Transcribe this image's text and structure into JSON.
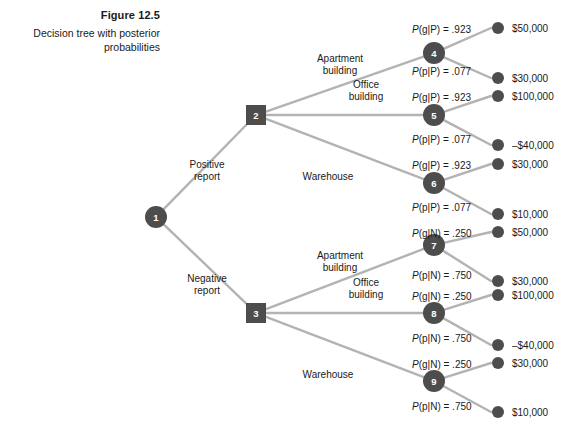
{
  "figure": {
    "number": "Figure 12.5",
    "description": "Decision tree with posterior probabilities"
  },
  "colors": {
    "node_fill": "#4d4d4d",
    "node_text": "#ffffff",
    "branch_line": "#b3b3b3",
    "terminal_dot": "#4d4d4d",
    "text": "#1a1a1a",
    "background": "#ffffff"
  },
  "chart_data": {
    "type": "diagram",
    "title": "Decision tree with posterior probabilities",
    "nodes": [
      {
        "id": "1",
        "label": "1",
        "shape": "circle",
        "x": 156,
        "y": 217
      },
      {
        "id": "2",
        "label": "2",
        "shape": "square",
        "x": 256,
        "y": 115
      },
      {
        "id": "3",
        "label": "3",
        "shape": "square",
        "x": 256,
        "y": 313
      },
      {
        "id": "4",
        "label": "4",
        "shape": "circle",
        "x": 434,
        "y": 53
      },
      {
        "id": "5",
        "label": "5",
        "shape": "circle",
        "x": 434,
        "y": 115
      },
      {
        "id": "6",
        "label": "6",
        "shape": "circle",
        "x": 434,
        "y": 183
      },
      {
        "id": "7",
        "label": "7",
        "shape": "circle",
        "x": 434,
        "y": 245
      },
      {
        "id": "8",
        "label": "8",
        "shape": "circle",
        "x": 434,
        "y": 313
      },
      {
        "id": "9",
        "label": "9",
        "shape": "circle",
        "x": 434,
        "y": 381
      }
    ],
    "stage1_branches": [
      {
        "from": "1",
        "to": "2",
        "label_line1": "Positive",
        "label_line2": "report"
      },
      {
        "from": "1",
        "to": "3",
        "label_line1": "Negative",
        "label_line2": "report"
      }
    ],
    "stage2_branches": [
      {
        "from": "2",
        "to": "4",
        "label_line1": "Apartment",
        "label_line2": "building"
      },
      {
        "from": "2",
        "to": "5",
        "label_line1": "Office",
        "label_line2": "building"
      },
      {
        "from": "2",
        "to": "6",
        "label_line1": "Warehouse",
        "label_line2": ""
      },
      {
        "from": "3",
        "to": "7",
        "label_line1": "Apartment",
        "label_line2": "building"
      },
      {
        "from": "3",
        "to": "8",
        "label_line1": "Office",
        "label_line2": "building"
      },
      {
        "from": "3",
        "to": "9",
        "label_line1": "Warehouse",
        "label_line2": ""
      }
    ],
    "outcomes": [
      {
        "from": "4",
        "prob_var": "P",
        "prob_args": "g|P",
        "prob_value": ".923",
        "prob_text": "P(g|P) = .923",
        "payoff": "$50,000",
        "dot_x": 498,
        "dot_y": 28,
        "label_x": 412,
        "label_y": 33
      },
      {
        "from": "4",
        "prob_var": "P",
        "prob_args": "p|P",
        "prob_value": ".077",
        "prob_text": "P(p|P) = .077",
        "payoff": "$30,000",
        "dot_x": 498,
        "dot_y": 78,
        "label_x": 412,
        "label_y": 75
      },
      {
        "from": "5",
        "prob_var": "P",
        "prob_args": "g|P",
        "prob_value": ".923",
        "prob_text": "P(g|P) = .923",
        "payoff": "$100,000",
        "dot_x": 498,
        "dot_y": 96,
        "label_x": 412,
        "label_y": 101
      },
      {
        "from": "5",
        "prob_var": "P",
        "prob_args": "p|P",
        "prob_value": ".077",
        "prob_text": "P(p|P) = .077",
        "payoff": "–$40,000",
        "dot_x": 498,
        "dot_y": 145,
        "label_x": 412,
        "label_y": 143
      },
      {
        "from": "6",
        "prob_var": "P",
        "prob_args": "g|P",
        "prob_value": ".923",
        "prob_text": "P(g|P) = .923",
        "payoff": "$30,000",
        "dot_x": 498,
        "dot_y": 164,
        "label_x": 412,
        "label_y": 169
      },
      {
        "from": "6",
        "prob_var": "P",
        "prob_args": "p|P",
        "prob_value": ".077",
        "prob_text": "P(p|P) = .077",
        "payoff": "$10,000",
        "dot_x": 498,
        "dot_y": 214,
        "label_x": 412,
        "label_y": 211
      },
      {
        "from": "7",
        "prob_var": "P",
        "prob_args": "g|N",
        "prob_value": ".250",
        "prob_text": "P(g|N) = .250",
        "payoff": "$50,000",
        "dot_x": 498,
        "dot_y": 232,
        "label_x": 412,
        "label_y": 237
      },
      {
        "from": "7",
        "prob_var": "P",
        "prob_args": "p|N",
        "prob_value": ".750",
        "prob_text": "P(p|N) = .750",
        "payoff": "$30,000",
        "dot_x": 498,
        "dot_y": 281,
        "label_x": 412,
        "label_y": 279
      },
      {
        "from": "8",
        "prob_var": "P",
        "prob_args": "g|N",
        "prob_value": ".250",
        "prob_text": "P(g|N) = .250",
        "payoff": "$100,000",
        "dot_x": 498,
        "dot_y": 295,
        "label_x": 412,
        "label_y": 300
      },
      {
        "from": "8",
        "prob_var": "P",
        "prob_args": "p|N",
        "prob_value": ".750",
        "prob_text": "P(p|N) = .750",
        "payoff": "–$40,000",
        "dot_x": 498,
        "dot_y": 345,
        "label_x": 412,
        "label_y": 342
      },
      {
        "from": "9",
        "prob_var": "P",
        "prob_args": "g|N",
        "prob_value": ".250",
        "prob_text": "P(g|N) = .250",
        "payoff": "$30,000",
        "dot_x": 498,
        "dot_y": 363,
        "label_x": 412,
        "label_y": 368
      },
      {
        "from": "9",
        "prob_var": "P",
        "prob_args": "p|N",
        "prob_value": ".750",
        "prob_text": "P(p|N) = .750",
        "payoff": "$10,000",
        "dot_x": 498,
        "dot_y": 412,
        "label_x": 412,
        "label_y": 410
      }
    ]
  }
}
